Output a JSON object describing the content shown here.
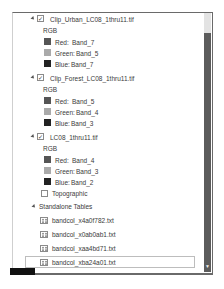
{
  "layers": [
    {
      "name": "Clip_Urban_LC08_1thru11.tif",
      "checked": true,
      "renderer": "RGB",
      "bands": [
        {
          "channel": "Red:",
          "band": "Band_7",
          "color": "#555555"
        },
        {
          "channel": "Green:",
          "band": "Band_5",
          "color": "#aaaaaa"
        },
        {
          "channel": "Blue:",
          "band": "Band_7",
          "color": "#222222"
        }
      ]
    },
    {
      "name": "Clip_Forest_LC08_1thru11.tif",
      "checked": true,
      "renderer": "RGB",
      "bands": [
        {
          "channel": "Red:",
          "band": "Band_5",
          "color": "#555555"
        },
        {
          "channel": "Green:",
          "band": "Band_4",
          "color": "#aaaaaa"
        },
        {
          "channel": "Blue:",
          "band": "Band_3",
          "color": "#222222"
        }
      ]
    },
    {
      "name": "LC08_1thru11.tif",
      "checked": true,
      "renderer": "RGB",
      "bands": [
        {
          "channel": "Red:",
          "band": "Band_4",
          "color": "#555555"
        },
        {
          "channel": "Green:",
          "band": "Band_3",
          "color": "#aaaaaa"
        },
        {
          "channel": "Blue:",
          "band": "Band_2",
          "color": "#222222"
        }
      ]
    }
  ],
  "basemap": {
    "name": "Topographic",
    "checked": false
  },
  "standalone_tables": {
    "header": "Standalone Tables",
    "items": [
      "bandcol_x4a0f782.txt",
      "bandcol_x0ab0ab1.txt",
      "bandcol_xaa4bd71.txt",
      "bandcol_xba24a01.txt"
    ],
    "selected_index": 3
  },
  "checkmark_glyph": "✓"
}
